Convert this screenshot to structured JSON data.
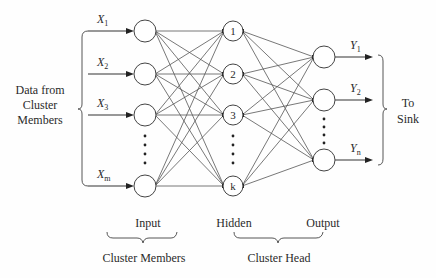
{
  "diagram": {
    "left_label": [
      "Data from",
      "Cluster",
      "Members"
    ],
    "right_label": [
      "To",
      "Sink"
    ],
    "layer_labels": {
      "input": "Input",
      "hidden": "Hidden",
      "output": "Output"
    },
    "group_labels": {
      "cluster_members": "Cluster Members",
      "cluster_head": "Cluster Head"
    },
    "input_nodes": [
      {
        "label": "X",
        "sub": "1",
        "y": 31
      },
      {
        "label": "X",
        "sub": "2",
        "y": 74
      },
      {
        "label": "X",
        "sub": "3",
        "y": 115
      },
      {
        "label": "X",
        "sub": "m",
        "y": 186
      }
    ],
    "hidden_nodes": [
      {
        "label": "1",
        "y": 31
      },
      {
        "label": "2",
        "y": 74
      },
      {
        "label": "3",
        "y": 115
      },
      {
        "label": "k",
        "y": 186
      }
    ],
    "output_nodes": [
      {
        "label": "Y",
        "sub": "1",
        "y": 57
      },
      {
        "label": "Y",
        "sub": "2",
        "y": 100
      },
      {
        "label": "Y",
        "sub": "n",
        "y": 160
      }
    ],
    "layout": {
      "input_x": 145,
      "hidden_x": 233,
      "output_x": 324,
      "node_r_input": 11,
      "node_r_hidden": 10,
      "node_r_output": 11
    },
    "ellipsis": "⋮",
    "colors": {
      "line": "#555555",
      "text": "#2a2a2a",
      "background": "#fefefe"
    }
  }
}
